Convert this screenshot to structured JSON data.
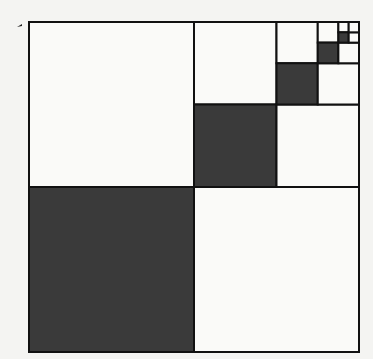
{
  "diagram": {
    "type": "geometric-series-squares",
    "colors": {
      "shaded": "#3a3a3a",
      "unshaded": "#fafaf8",
      "stroke": "#111111",
      "background": "#f4f4f2"
    },
    "outer_square": {
      "x": 29,
      "y": 22,
      "size": 330
    },
    "levels": [
      {
        "level": 1,
        "shaded_fraction": "1/4"
      },
      {
        "level": 2,
        "shaded_fraction": "1/16"
      },
      {
        "level": 3,
        "shaded_fraction": "1/64"
      },
      {
        "level": 4,
        "shaded_fraction": "1/256"
      },
      {
        "level": 5,
        "shaded_fraction": "1/1024"
      }
    ],
    "depth": 5
  }
}
